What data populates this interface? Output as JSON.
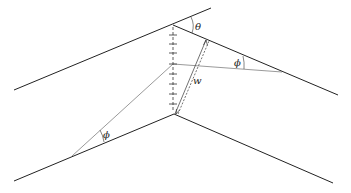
{
  "diagram": {
    "type": "grain-boundary geometry",
    "labels": {
      "theta": "θ",
      "phi_upper": "ϕ",
      "phi_lower": "ϕ",
      "width": "w"
    },
    "colors": {
      "line": "#222222",
      "thin_line": "#555555"
    }
  }
}
